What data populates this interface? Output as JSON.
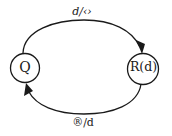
{
  "diagram": {
    "type": "state-machine",
    "colors": {
      "stroke": "#1a1a1a",
      "background": "#ffffff"
    },
    "nodes": [
      {
        "id": "Q",
        "label": "Q"
      },
      {
        "id": "R",
        "label": "R(d)"
      }
    ],
    "edges": [
      {
        "from": "Q",
        "to": "R",
        "label": "d/‹›",
        "position": "top"
      },
      {
        "from": "R",
        "to": "Q",
        "label": "®/d",
        "position": "bottom"
      }
    ]
  }
}
